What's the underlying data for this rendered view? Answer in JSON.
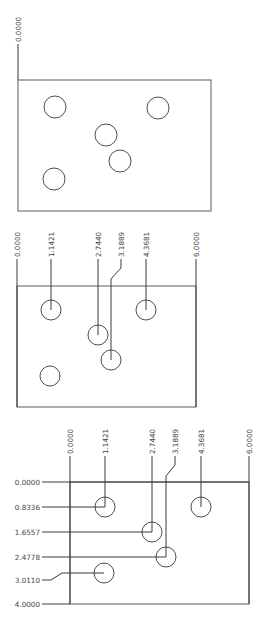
{
  "drawing": {
    "panels": [
      {
        "name": "unmarked-view",
        "box": {
          "x": 18,
          "y": 80,
          "w": 193,
          "h": 131
        },
        "origin_label": {
          "text": "0.0000",
          "x": 18,
          "y_text_end": 42
        },
        "holes": [
          {
            "cx": 55,
            "cy": 107,
            "r": 11
          },
          {
            "cx": 158,
            "cy": 108,
            "r": 11
          },
          {
            "cx": 106,
            "cy": 135,
            "r": 11
          },
          {
            "cx": 120,
            "cy": 161,
            "r": 11
          },
          {
            "cx": 54,
            "cy": 179,
            "r": 11
          }
        ]
      },
      {
        "name": "x-dimension-view",
        "box": {
          "x": 17,
          "y": 286,
          "w": 179,
          "h": 121
        },
        "label_base_y": 258,
        "x_dims": [
          {
            "text": "0.0000",
            "x": 17
          },
          {
            "text": "1.1421",
            "x": 51
          },
          {
            "text": "2.7440",
            "x": 98
          },
          {
            "text": "3.1889",
            "x": 111,
            "jog_from": 121
          },
          {
            "text": "4.3681",
            "x": 146
          },
          {
            "text": "6.0000",
            "x": 196
          }
        ],
        "holes": [
          {
            "cx": 51,
            "cy": 310,
            "r": 10,
            "leader_x": 51
          },
          {
            "cx": 98,
            "cy": 335,
            "r": 10,
            "leader_x": 98
          },
          {
            "cx": 111,
            "cy": 360,
            "r": 10,
            "leader_x": 111
          },
          {
            "cx": 146,
            "cy": 310,
            "r": 10,
            "leader_x": 146
          },
          {
            "cx": 50,
            "cy": 376,
            "r": 10
          }
        ]
      },
      {
        "name": "xy-dimension-view",
        "box": {
          "x": 70,
          "y": 482,
          "w": 179,
          "h": 122
        },
        "label_base_y": 455,
        "x_dims": [
          {
            "text": "0.0000",
            "x": 70
          },
          {
            "text": "1.1421",
            "x": 105
          },
          {
            "text": "2.7440",
            "x": 152
          },
          {
            "text": "3.1889",
            "x": 166,
            "jog_from": 175
          },
          {
            "text": "4.3681",
            "x": 201
          },
          {
            "text": "6.0000",
            "x": 249
          }
        ],
        "y_dims": [
          {
            "text": "0.0000",
            "y": 482
          },
          {
            "text": "0.8336",
            "y": 507
          },
          {
            "text": "1.6557",
            "y": 532
          },
          {
            "text": "2.4778",
            "y": 557
          },
          {
            "text": "3.0110",
            "y": 573,
            "jog_from": 580
          },
          {
            "text": "4.0000",
            "y": 604
          }
        ],
        "holes": [
          {
            "cx": 105,
            "cy": 507,
            "r": 10
          },
          {
            "cx": 152,
            "cy": 532,
            "r": 10
          },
          {
            "cx": 166,
            "cy": 557,
            "r": 10
          },
          {
            "cx": 201,
            "cy": 507,
            "r": 10
          },
          {
            "cx": 104,
            "cy": 573,
            "r": 10
          }
        ]
      }
    ]
  }
}
